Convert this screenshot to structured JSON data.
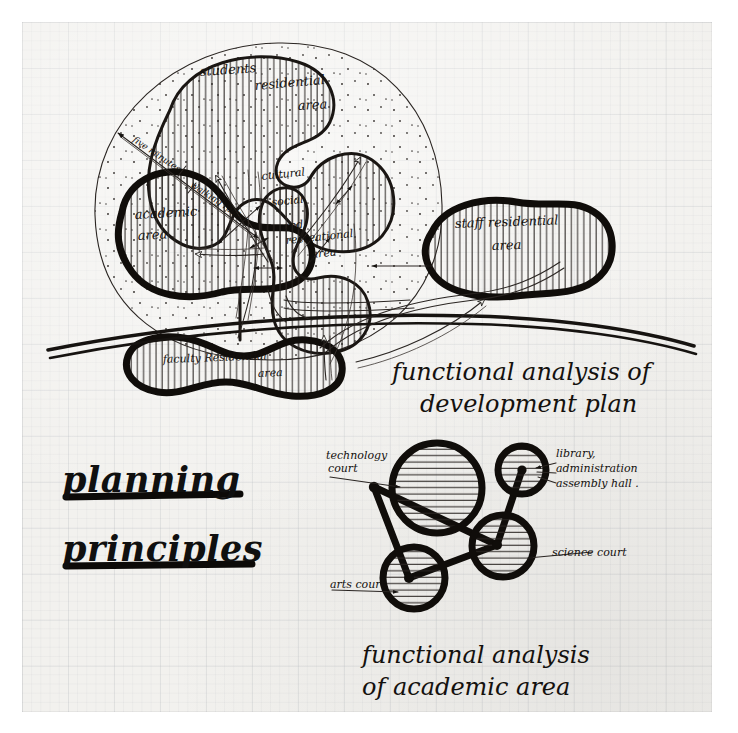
{
  "document": {
    "medium": "hand-drawn pencil and ink sketch on graph paper",
    "sheet_color": "#f2f1ee",
    "ink_color": "#161310",
    "title_block": {
      "line1": "planning",
      "line2": "principles"
    }
  },
  "diagram_development_plan": {
    "caption_line1": "functional analysis of",
    "caption_line2": "development plan",
    "zones": [
      {
        "id": "students-residential",
        "label_line1": "students",
        "label_line2": "residential",
        "label_line3": "area",
        "hatch": "vertical"
      },
      {
        "id": "academic",
        "label_line1": "academic",
        "label_line2": "area",
        "hatch": "vertical"
      },
      {
        "id": "cultural-social-rec",
        "label_line1": "cultural",
        "label_line2": "social",
        "label_line3": "and",
        "label_line4": "recreational",
        "label_line5": "area",
        "hatch": "vertical"
      },
      {
        "id": "staff-residential",
        "label_line1": "staff residential",
        "label_line2": "area",
        "hatch": "vertical"
      },
      {
        "id": "faculty-residential",
        "label_line1": "faculty  Residential",
        "label_line2": "area",
        "hatch": "vertical"
      }
    ],
    "annotations": [
      {
        "id": "walking-radius-1",
        "text": "five minutes"
      },
      {
        "id": "walking-radius-2",
        "text": "walking radius"
      }
    ]
  },
  "diagram_academic_area": {
    "caption_line1": "functional analysis",
    "caption_line2": "of academic area",
    "courts": [
      {
        "id": "technology-court",
        "label_line1": "technology",
        "label_line2": "court",
        "size": "large"
      },
      {
        "id": "library-admin",
        "label_line1": "library,",
        "label_line2": "administration",
        "label_line3": "assembly hall .",
        "size": "small"
      },
      {
        "id": "science-court",
        "label_line1": "science court",
        "size": "medium"
      },
      {
        "id": "arts-court",
        "label_line1": "arts court",
        "size": "medium"
      }
    ]
  }
}
